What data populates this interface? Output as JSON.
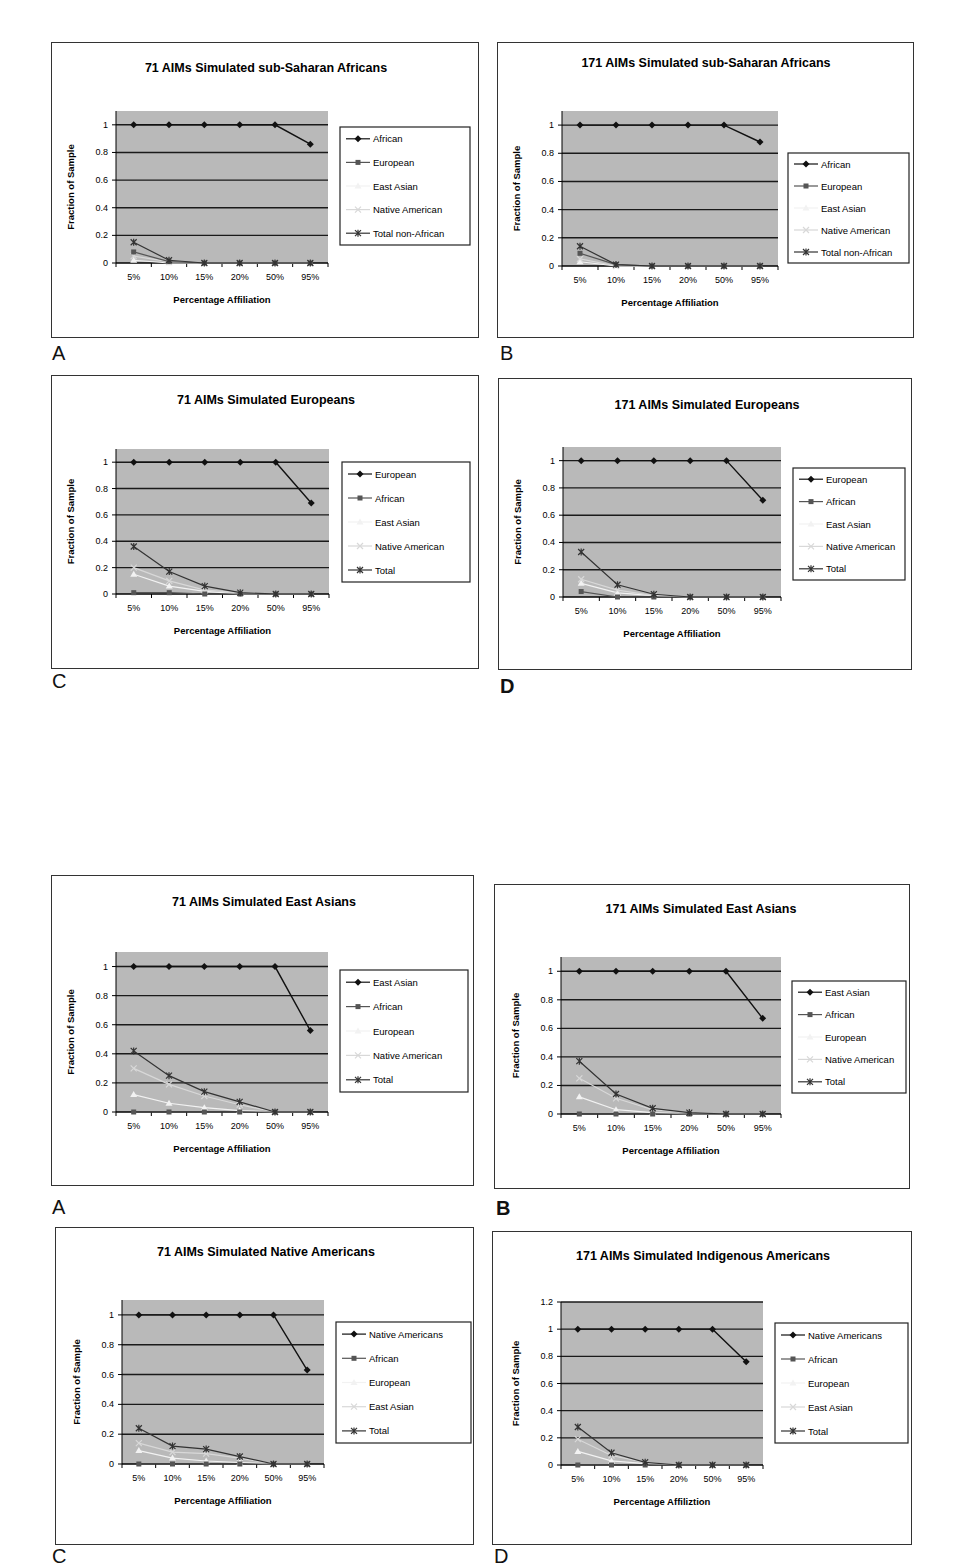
{
  "figure": {
    "x_categories": [
      "5%",
      "10%",
      "15%",
      "20%",
      "50%",
      "95%"
    ],
    "xlabel": "Percentage Affiliation",
    "ylabel": "Fraction of Sample",
    "colors": {
      "plot_bg": "#b9b9b9",
      "grid": "#1a1a1a",
      "series": [
        "#111111",
        "#555555",
        "#f2f2f2",
        "#d8d8d8",
        "#333333"
      ]
    }
  },
  "chart_data": [
    {
      "id": "top-A",
      "panel_label": "A",
      "type": "line",
      "title": "71 AIMs Simulated sub-Saharan Africans",
      "xlabel": "Percentage Affiliation",
      "ylabel": "Fraction of Sample",
      "categories": [
        "5%",
        "10%",
        "15%",
        "20%",
        "50%",
        "95%"
      ],
      "ylim": [
        0,
        1.1
      ],
      "yticks": [
        "0",
        "0.2",
        "0.4",
        "0.6",
        "0.8",
        "1"
      ],
      "grid": true,
      "legend_position": "right",
      "series": [
        {
          "name": "African",
          "values": [
            1,
            1,
            1,
            1,
            1,
            0.86
          ]
        },
        {
          "name": "European",
          "values": [
            0.08,
            0.01,
            0,
            0,
            0,
            0
          ]
        },
        {
          "name": "East Asian",
          "values": [
            0.02,
            0,
            0,
            0,
            0,
            0
          ]
        },
        {
          "name": "Native American",
          "values": [
            0.05,
            0.01,
            0,
            0,
            0,
            0
          ]
        },
        {
          "name": "Total non-African",
          "values": [
            0.15,
            0.02,
            0,
            0,
            0,
            0
          ]
        }
      ]
    },
    {
      "id": "top-B",
      "panel_label": "B",
      "type": "line",
      "title": "171 AIMs Simulated sub-Saharan Africans",
      "xlabel": "Percentage Affiliation",
      "ylabel": "Fraction of Sample",
      "categories": [
        "5%",
        "10%",
        "15%",
        "20%",
        "50%",
        "95%"
      ],
      "ylim": [
        0,
        1.1
      ],
      "yticks": [
        "0",
        "0.2",
        "0.4",
        "0.6",
        "0.8",
        "1"
      ],
      "grid": true,
      "legend_position": "right",
      "series": [
        {
          "name": "African",
          "values": [
            1,
            1,
            1,
            1,
            1,
            0.88
          ]
        },
        {
          "name": "European",
          "values": [
            0.09,
            0.01,
            0,
            0,
            0,
            0
          ]
        },
        {
          "name": "East Asian",
          "values": [
            0.03,
            0,
            0,
            0,
            0,
            0
          ]
        },
        {
          "name": "Native American",
          "values": [
            0.05,
            0,
            0,
            0,
            0,
            0
          ]
        },
        {
          "name": "Total non-African",
          "values": [
            0.14,
            0.01,
            0,
            0,
            0,
            0
          ]
        }
      ]
    },
    {
      "id": "top-C",
      "panel_label": "C",
      "type": "line",
      "title": "71 AIMs Simulated Europeans",
      "xlabel": "Percentage Affiliation",
      "ylabel": "Fraction of Sample",
      "categories": [
        "5%",
        "10%",
        "15%",
        "20%",
        "50%",
        "95%"
      ],
      "ylim": [
        0,
        1.1
      ],
      "yticks": [
        "0",
        "0.2",
        "0.4",
        "0.6",
        "0.8",
        "1"
      ],
      "grid": true,
      "legend_position": "right",
      "series": [
        {
          "name": "European",
          "values": [
            1,
            1,
            1,
            1,
            1,
            0.69
          ]
        },
        {
          "name": "African",
          "values": [
            0.01,
            0.01,
            0,
            0,
            0,
            0
          ]
        },
        {
          "name": "East Asian",
          "values": [
            0.15,
            0.06,
            0.02,
            0,
            0,
            0
          ]
        },
        {
          "name": "Native American",
          "values": [
            0.2,
            0.1,
            0.03,
            0.01,
            0,
            0
          ]
        },
        {
          "name": "Total",
          "values": [
            0.36,
            0.17,
            0.06,
            0.01,
            0,
            0
          ]
        }
      ]
    },
    {
      "id": "top-D",
      "panel_label": "D",
      "type": "line",
      "title": "171 AIMs Simulated Europeans",
      "xlabel": "Percentage Affiliation",
      "ylabel": "Fraction of Sample",
      "categories": [
        "5%",
        "10%",
        "15%",
        "20%",
        "50%",
        "95%"
      ],
      "ylim": [
        0,
        1.1
      ],
      "yticks": [
        "0",
        "0.2",
        "0.4",
        "0.6",
        "0.8",
        "1"
      ],
      "grid": true,
      "legend_position": "right",
      "series": [
        {
          "name": "European",
          "values": [
            1,
            1,
            1,
            1,
            1,
            0.71
          ]
        },
        {
          "name": "African",
          "values": [
            0.04,
            0,
            0,
            0,
            0,
            0
          ]
        },
        {
          "name": "East Asian",
          "values": [
            0.1,
            0.03,
            0.01,
            0,
            0,
            0
          ]
        },
        {
          "name": "Native American",
          "values": [
            0.13,
            0.05,
            0.01,
            0,
            0,
            0
          ]
        },
        {
          "name": "Total",
          "values": [
            0.33,
            0.09,
            0.02,
            0,
            0,
            0
          ]
        }
      ]
    },
    {
      "id": "bottom-A",
      "panel_label": "A",
      "type": "line",
      "title": "71 AIMs Simulated East Asians",
      "xlabel": "Percentage Affiliation",
      "ylabel": "Fraction of Sample",
      "categories": [
        "5%",
        "10%",
        "15%",
        "20%",
        "50%",
        "95%"
      ],
      "ylim": [
        0,
        1.1
      ],
      "yticks": [
        "0",
        "0.2",
        "0.4",
        "0.6",
        "0.8",
        "1"
      ],
      "grid": true,
      "legend_position": "right",
      "series": [
        {
          "name": "East Asian",
          "values": [
            1,
            1,
            1,
            1,
            1,
            0.56
          ]
        },
        {
          "name": "African",
          "values": [
            0,
            0,
            0,
            0,
            0,
            0
          ]
        },
        {
          "name": "European",
          "values": [
            0.12,
            0.06,
            0.03,
            0.01,
            0,
            0
          ]
        },
        {
          "name": "Native American",
          "values": [
            0.3,
            0.19,
            0.11,
            0.05,
            0,
            0
          ]
        },
        {
          "name": "Total",
          "values": [
            0.42,
            0.25,
            0.14,
            0.07,
            0,
            0
          ]
        }
      ]
    },
    {
      "id": "bottom-B",
      "panel_label": "B",
      "type": "line",
      "title": "171 AIMs Simulated East Asians",
      "xlabel": "Percentage Affiliation",
      "ylabel": "Fraction of Sample",
      "categories": [
        "5%",
        "10%",
        "15%",
        "20%",
        "50%",
        "95%"
      ],
      "ylim": [
        0,
        1.1
      ],
      "yticks": [
        "0",
        "0.2",
        "0.4",
        "0.6",
        "0.8",
        "1"
      ],
      "grid": true,
      "legend_position": "right",
      "series": [
        {
          "name": "East Asian",
          "values": [
            1,
            1,
            1,
            1,
            1,
            0.67
          ]
        },
        {
          "name": "African",
          "values": [
            0,
            0,
            0,
            0,
            0,
            0
          ]
        },
        {
          "name": "European",
          "values": [
            0.12,
            0.03,
            0.01,
            0,
            0,
            0
          ]
        },
        {
          "name": "Native American",
          "values": [
            0.25,
            0.11,
            0.03,
            0.01,
            0,
            0
          ]
        },
        {
          "name": "Total",
          "values": [
            0.37,
            0.14,
            0.04,
            0.01,
            0,
            0
          ]
        }
      ]
    },
    {
      "id": "bottom-C",
      "panel_label": "C",
      "type": "line",
      "title": "71 AIMs Simulated Native Americans",
      "xlabel": "Percentage Affiliation",
      "ylabel": "Fraction of Sample",
      "categories": [
        "5%",
        "10%",
        "15%",
        "20%",
        "50%",
        "95%"
      ],
      "ylim": [
        0,
        1.1
      ],
      "yticks": [
        "0",
        "0.2",
        "0.4",
        "0.6",
        "0.8",
        "1"
      ],
      "grid": true,
      "legend_position": "right",
      "series": [
        {
          "name": "Native Americans",
          "values": [
            1,
            1,
            1,
            1,
            1,
            0.63
          ]
        },
        {
          "name": "African",
          "values": [
            0,
            0,
            0,
            0,
            0,
            0
          ]
        },
        {
          "name": "European",
          "values": [
            0.09,
            0.04,
            0.02,
            0.01,
            0,
            0
          ]
        },
        {
          "name": "East Asian",
          "values": [
            0.14,
            0.08,
            0.07,
            0.04,
            0,
            0
          ]
        },
        {
          "name": "Total",
          "values": [
            0.24,
            0.12,
            0.1,
            0.05,
            0,
            0
          ]
        }
      ]
    },
    {
      "id": "bottom-D",
      "panel_label": "D",
      "type": "line",
      "title": "171 AIMs Simulated Indigenous Americans",
      "xlabel": "Percentage Affiliztion",
      "ylabel": "Fraction of Sample",
      "categories": [
        "5%",
        "10%",
        "15%",
        "20%",
        "50%",
        "95%"
      ],
      "ylim": [
        0,
        1.2
      ],
      "yticks": [
        "0",
        "0.2",
        "0.4",
        "0.6",
        "0.8",
        "1",
        "1.2"
      ],
      "grid": true,
      "legend_position": "right",
      "series": [
        {
          "name": "Native Americans",
          "values": [
            1,
            1,
            1,
            1,
            1,
            0.76
          ]
        },
        {
          "name": "African",
          "values": [
            0,
            0,
            0,
            0,
            0,
            0
          ]
        },
        {
          "name": "European",
          "values": [
            0.1,
            0.03,
            0.01,
            0,
            0,
            0
          ]
        },
        {
          "name": "East Asian",
          "values": [
            0.19,
            0.07,
            0.02,
            0,
            0,
            0
          ]
        },
        {
          "name": "Total",
          "values": [
            0.28,
            0.09,
            0.02,
            0,
            0,
            0
          ]
        }
      ]
    }
  ]
}
